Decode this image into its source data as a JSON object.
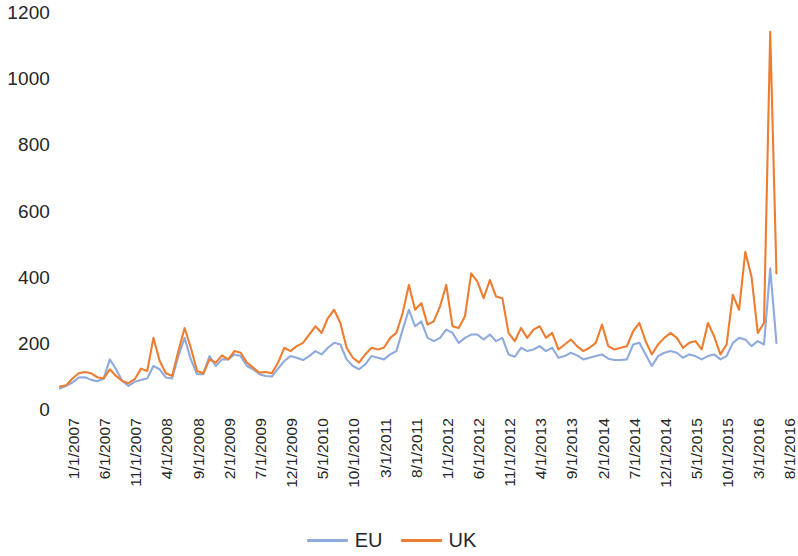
{
  "chart_data": {
    "type": "line",
    "title": "",
    "subtitle": "",
    "xlabel": "",
    "ylabel": "",
    "ylim": [
      0,
      1200
    ],
    "y_ticks": [
      1200,
      1000,
      800,
      600,
      400,
      200,
      0
    ],
    "grid": false,
    "legend_position": "bottom-center",
    "x_tick_labels": [
      "1/1/2007",
      "6/1/2007",
      "11/1/2007",
      "4/1/2008",
      "9/1/2008",
      "2/1/2009",
      "7/1/2009",
      "12/1/2009",
      "5/1/2010",
      "10/1/2010",
      "3/1/2011",
      "8/1/2011",
      "1/1/2012",
      "6/1/2012",
      "11/1/2012",
      "4/1/2013",
      "9/1/2013",
      "2/1/2014",
      "7/1/2014",
      "12/1/2014",
      "5/1/2015",
      "10/1/2015",
      "3/1/2016",
      "8/1/2016"
    ],
    "x_tick_interval_months": 5,
    "x": [
      "1/1/2007",
      "2/1/2007",
      "3/1/2007",
      "4/1/2007",
      "5/1/2007",
      "6/1/2007",
      "7/1/2007",
      "8/1/2007",
      "9/1/2007",
      "10/1/2007",
      "11/1/2007",
      "12/1/2007",
      "1/1/2008",
      "2/1/2008",
      "3/1/2008",
      "4/1/2008",
      "5/1/2008",
      "6/1/2008",
      "7/1/2008",
      "8/1/2008",
      "9/1/2008",
      "10/1/2008",
      "11/1/2008",
      "12/1/2008",
      "1/1/2009",
      "2/1/2009",
      "3/1/2009",
      "4/1/2009",
      "5/1/2009",
      "6/1/2009",
      "7/1/2009",
      "8/1/2009",
      "9/1/2009",
      "10/1/2009",
      "11/1/2009",
      "12/1/2009",
      "1/1/2010",
      "2/1/2010",
      "3/1/2010",
      "4/1/2010",
      "5/1/2010",
      "6/1/2010",
      "7/1/2010",
      "8/1/2010",
      "9/1/2010",
      "10/1/2010",
      "11/1/2010",
      "12/1/2010",
      "1/1/2011",
      "2/1/2011",
      "3/1/2011",
      "4/1/2011",
      "5/1/2011",
      "6/1/2011",
      "7/1/2011",
      "8/1/2011",
      "9/1/2011",
      "10/1/2011",
      "11/1/2011",
      "12/1/2011",
      "1/1/2012",
      "2/1/2012",
      "3/1/2012",
      "4/1/2012",
      "5/1/2012",
      "6/1/2012",
      "7/1/2012",
      "8/1/2012",
      "9/1/2012",
      "10/1/2012",
      "11/1/2012",
      "12/1/2012",
      "1/1/2013",
      "2/1/2013",
      "3/1/2013",
      "4/1/2013",
      "5/1/2013",
      "6/1/2013",
      "7/1/2013",
      "8/1/2013",
      "9/1/2013",
      "10/1/2013",
      "11/1/2013",
      "12/1/2013",
      "1/1/2014",
      "2/1/2014",
      "3/1/2014",
      "4/1/2014",
      "5/1/2014",
      "6/1/2014",
      "7/1/2014",
      "8/1/2014",
      "9/1/2014",
      "10/1/2014",
      "11/1/2014",
      "12/1/2014",
      "1/1/2015",
      "2/1/2015",
      "3/1/2015",
      "4/1/2015",
      "5/1/2015",
      "6/1/2015",
      "7/1/2015",
      "8/1/2015",
      "9/1/2015",
      "10/1/2015",
      "11/1/2015",
      "12/1/2015",
      "1/1/2016",
      "2/1/2016",
      "3/1/2016",
      "4/1/2016",
      "5/1/2016",
      "6/1/2016",
      "7/1/2016",
      "8/1/2016"
    ],
    "series": [
      {
        "name": "EU",
        "color": "#8FAADC",
        "values": [
          62,
          70,
          80,
          95,
          96,
          88,
          84,
          92,
          150,
          120,
          85,
          70,
          82,
          88,
          92,
          130,
          120,
          95,
          92,
          160,
          215,
          150,
          105,
          105,
          160,
          130,
          150,
          150,
          165,
          160,
          130,
          120,
          105,
          100,
          98,
          122,
          145,
          160,
          155,
          148,
          160,
          175,
          165,
          185,
          200,
          195,
          150,
          130,
          120,
          135,
          160,
          155,
          150,
          165,
          175,
          240,
          300,
          250,
          265,
          215,
          205,
          215,
          240,
          230,
          200,
          215,
          225,
          225,
          210,
          225,
          205,
          215,
          165,
          158,
          185,
          175,
          180,
          190,
          175,
          185,
          155,
          160,
          170,
          162,
          150,
          155,
          160,
          165,
          152,
          148,
          148,
          150,
          195,
          200,
          165,
          130,
          160,
          170,
          175,
          170,
          155,
          165,
          160,
          150,
          160,
          165,
          150,
          160,
          200,
          215,
          210,
          190,
          205,
          195,
          425,
          200
        ]
      },
      {
        "name": "UK",
        "color": "#ED7D31",
        "values": [
          68,
          72,
          92,
          108,
          112,
          108,
          96,
          92,
          120,
          100,
          85,
          78,
          90,
          122,
          115,
          215,
          145,
          108,
          100,
          175,
          245,
          185,
          115,
          108,
          150,
          140,
          162,
          150,
          175,
          170,
          140,
          125,
          110,
          112,
          108,
          140,
          185,
          175,
          190,
          200,
          225,
          250,
          230,
          275,
          300,
          260,
          185,
          155,
          140,
          165,
          185,
          180,
          185,
          215,
          230,
          290,
          375,
          300,
          320,
          255,
          265,
          310,
          375,
          250,
          245,
          280,
          410,
          385,
          335,
          390,
          340,
          335,
          230,
          205,
          245,
          215,
          240,
          250,
          215,
          230,
          180,
          195,
          210,
          190,
          175,
          185,
          200,
          255,
          190,
          180,
          185,
          190,
          235,
          260,
          205,
          165,
          195,
          215,
          230,
          215,
          185,
          200,
          205,
          180,
          260,
          220,
          165,
          195,
          345,
          300,
          475,
          400,
          230,
          260,
          1140,
          410
        ]
      }
    ]
  },
  "legend": {
    "items": [
      {
        "label": "EU",
        "color": "#8FAADC"
      },
      {
        "label": "UK",
        "color": "#ED7D31"
      }
    ]
  }
}
